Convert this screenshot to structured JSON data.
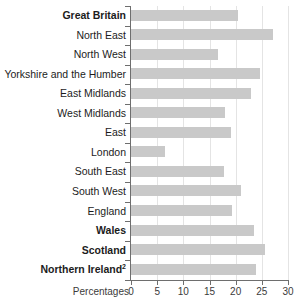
{
  "chart_data": {
    "type": "bar",
    "orientation": "horizontal",
    "title": "",
    "subtitle": "",
    "xlabel": "Percentages",
    "ylabel": "",
    "xlim": [
      0,
      30
    ],
    "xticks": [
      0,
      5,
      10,
      15,
      20,
      25,
      30
    ],
    "xtick_labels": [
      "0",
      "5",
      "10",
      "15",
      "20",
      "25",
      "30"
    ],
    "grid": true,
    "grid_axis": "x",
    "legend": false,
    "legend_position": "none",
    "bar_color": "#c9c9c9",
    "axis_color": "#6e6e6e",
    "grid_color": "#e4e4e4",
    "categories": [
      "Great Britain",
      "North East",
      "North West",
      "Yorkshire and the Humber",
      "East Midlands",
      "West Midlands",
      "East",
      "London",
      "South East",
      "South West",
      "England",
      "Wales",
      "Scotland",
      "Northern Ireland"
    ],
    "values": [
      20.5,
      27.1,
      16.6,
      24.7,
      23.0,
      18.0,
      19.1,
      6.5,
      17.8,
      21.0,
      19.3,
      23.5,
      25.6,
      23.9
    ],
    "bold_categories": [
      "Great Britain",
      "Wales",
      "Scotland",
      "Northern Ireland"
    ],
    "footnote_markers": {
      "Northern Ireland": "2"
    },
    "rows": [
      {
        "label": "Great Britain",
        "value": 20.5,
        "bold": true,
        "sup": ""
      },
      {
        "label": "North East",
        "value": 27.1,
        "bold": false,
        "sup": ""
      },
      {
        "label": "North West",
        "value": 16.6,
        "bold": false,
        "sup": ""
      },
      {
        "label": "Yorkshire and the Humber",
        "value": 24.7,
        "bold": false,
        "sup": ""
      },
      {
        "label": "East Midlands",
        "value": 23.0,
        "bold": false,
        "sup": ""
      },
      {
        "label": "West Midlands",
        "value": 18.0,
        "bold": false,
        "sup": ""
      },
      {
        "label": "East",
        "value": 19.1,
        "bold": false,
        "sup": ""
      },
      {
        "label": "London",
        "value": 6.5,
        "bold": false,
        "sup": ""
      },
      {
        "label": "South East",
        "value": 17.8,
        "bold": false,
        "sup": ""
      },
      {
        "label": "South West",
        "value": 21.0,
        "bold": false,
        "sup": ""
      },
      {
        "label": "England",
        "value": 19.3,
        "bold": false,
        "sup": ""
      },
      {
        "label": "Wales",
        "value": 23.5,
        "bold": true,
        "sup": ""
      },
      {
        "label": "Scotland",
        "value": 25.6,
        "bold": true,
        "sup": ""
      },
      {
        "label": "Northern Ireland",
        "value": 23.9,
        "bold": true,
        "sup": "2"
      }
    ]
  }
}
